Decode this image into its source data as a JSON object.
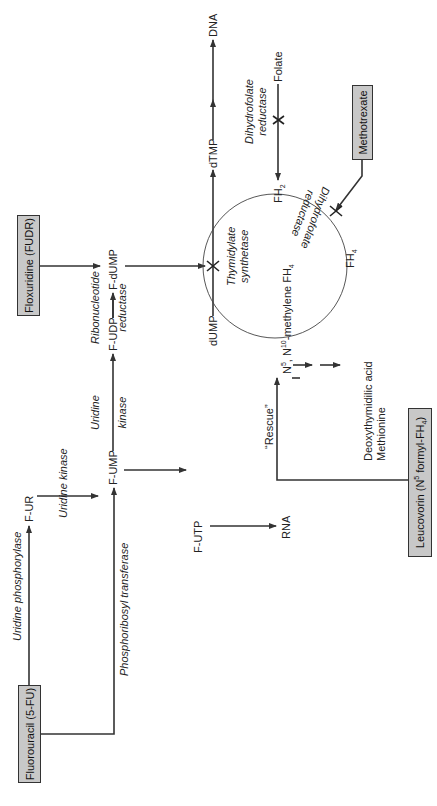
{
  "drugs": {
    "fluorouracil": "Fluorouracil (5-FU)",
    "floxuridine": "Floxuridine (FUDR)",
    "methotrexate": "Methotrexate",
    "leucovorin_prefix": "Leucovorin (N",
    "leucovorin_sup": "5",
    "leucovorin_mid": " formyl-FH",
    "leucovorin_sub": "4",
    "leucovorin_suffix": ")"
  },
  "metabolites": {
    "f_ur": "F-UR",
    "f_ump": "F-UMP",
    "f_udp": "F-UDP",
    "f_dump": "F-dUMP",
    "f_utp": "F-UTP",
    "rna": "RNA",
    "dump": "dUMP",
    "dtmp": "dTMP",
    "dna": "DNA",
    "folate": "Folate",
    "fh2_base": "FH",
    "fh2_sub": "2",
    "fh4_base": "FH",
    "fh4_sub": "4",
    "n5n10_a": "N",
    "n5n10_sup1": "5",
    "n5n10_b": ", N",
    "n5n10_sup2": "10",
    "n5n10_c": "-methylene FH",
    "n5n10_sub": "4",
    "deoxythymidilic_acid": "Deoxythymidilic acid",
    "methionine": "Methionine"
  },
  "enzymes": {
    "uridine_phosphorylase": "Uridine phosphorylase",
    "phosphoribosyl_transferase": "Phosphoribosyl transferase",
    "uridine_kinase_1": "Uridine kinase",
    "uridine_kinase_2a": "Uridine",
    "uridine_kinase_2b": "kinase",
    "ribonucleotide_reductase_a": "Ribonucleotide",
    "ribonucleotide_reductase_b": "reductase",
    "thymidylate_synthetase_a": "Thymidylate",
    "thymidylate_synthetase_b": "synthetase",
    "dihydrofolate_reductase_a": "Dihydrofolate",
    "dihydrofolate_reductase_b": "reductase",
    "dihydrofolate_reductase_cycle_a": "Dihydrofolate",
    "dihydrofolate_reductase_cycle_b": "reductase"
  },
  "annotations": {
    "rescue": "“Rescue”"
  },
  "colors": {
    "box_fill": "#c8c8c8",
    "line": "#333333",
    "background": "#ffffff"
  }
}
